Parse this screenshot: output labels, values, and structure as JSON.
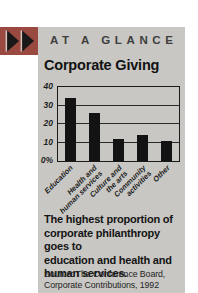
{
  "palette": {
    "card_bg": "#c8c7c3",
    "accent_red": "#99493f",
    "ink": "#1a1a1a",
    "header_gray": "#3d3d3d",
    "bar_black": "#131313"
  },
  "header": {
    "eyebrow": "AT A GLANCE"
  },
  "icons": {
    "double_arrow": "double-right-triangles"
  },
  "chart_data": {
    "type": "bar",
    "title": "Corporate Giving",
    "categories": [
      "Education",
      "Health and\nhuman services",
      "Culture and\nthe arts",
      "Community\nactivities",
      "Other"
    ],
    "values": [
      34,
      26,
      12,
      14,
      11
    ],
    "unit": "%",
    "xlabel": "",
    "ylabel": "",
    "ylim": [
      0,
      40
    ],
    "ytick_values": [
      40,
      30,
      20,
      10,
      0
    ],
    "ytick_labels": [
      "40",
      "30",
      "20",
      "10",
      "0%"
    ],
    "gridline_values": [
      10,
      20,
      30
    ],
    "grid": true,
    "legend": false,
    "bar_color": "#131313"
  },
  "caption": {
    "text": "The highest proportion of\ncorporate philanthropy goes to\neducation and health and\nhuman services."
  },
  "source": {
    "text": "Source: The Conference Board,\nCorporate Contributions, 1992"
  }
}
